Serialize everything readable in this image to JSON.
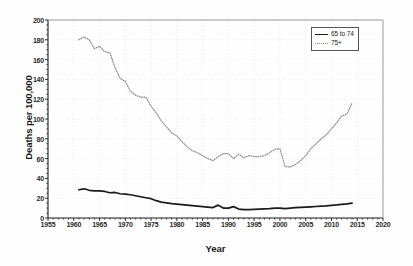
{
  "chart_data": {
    "type": "line",
    "title": "",
    "xlabel": "Year",
    "ylabel": "Deaths per 100,000",
    "xlim": [
      1955,
      2020
    ],
    "ylim": [
      0,
      200
    ],
    "xticks": [
      1955,
      1960,
      1965,
      1970,
      1975,
      1980,
      1985,
      1990,
      1995,
      2000,
      2005,
      2010,
      2015,
      2020
    ],
    "yticks": [
      0,
      20,
      40,
      60,
      80,
      100,
      120,
      140,
      160,
      180,
      200
    ],
    "grid": true,
    "legend_position": "top-right",
    "x": [
      1961,
      1962,
      1963,
      1964,
      1965,
      1966,
      1967,
      1968,
      1969,
      1970,
      1971,
      1972,
      1973,
      1974,
      1975,
      1976,
      1977,
      1978,
      1979,
      1980,
      1981,
      1982,
      1983,
      1984,
      1985,
      1986,
      1987,
      1988,
      1989,
      1990,
      1991,
      1992,
      1993,
      1994,
      1995,
      1996,
      1997,
      1998,
      1999,
      2000,
      2001,
      2002,
      2003,
      2004,
      2005,
      2006,
      2007,
      2008,
      2009,
      2010,
      2011,
      2012,
      2013,
      2014
    ],
    "series": [
      {
        "name": "65 to 74",
        "style": "solid",
        "color": "#1a1a1a",
        "values": [
          28.5,
          29.5,
          28.0,
          27.5,
          27.3,
          26.8,
          25.5,
          25.8,
          24.5,
          24.2,
          23.5,
          22.5,
          21.5,
          20.5,
          19.5,
          17.5,
          16.0,
          15.2,
          14.5,
          14.0,
          13.5,
          13.0,
          12.5,
          12.0,
          11.5,
          11.0,
          10.5,
          13.0,
          10.0,
          10.0,
          11.5,
          9.0,
          8.5,
          8.5,
          8.8,
          9.0,
          9.2,
          9.5,
          10.0,
          10.0,
          9.5,
          10.0,
          10.5,
          10.8,
          11.0,
          11.3,
          11.6,
          12.0,
          12.3,
          12.8,
          13.2,
          13.8,
          14.3,
          15.0
        ]
      },
      {
        "name": "75+",
        "style": "dotted",
        "color": "#8a8a8a",
        "values": [
          180.0,
          183.0,
          180.0,
          171.0,
          173.5,
          168.0,
          167.0,
          152.0,
          141.0,
          138.0,
          128.0,
          124.0,
          122.0,
          122.0,
          113.0,
          106.0,
          98.0,
          92.0,
          86.0,
          83.0,
          77.0,
          72.0,
          68.0,
          66.0,
          63.0,
          60.0,
          58.0,
          62.0,
          65.0,
          65.0,
          60.0,
          64.5,
          61.0,
          63.0,
          62.0,
          62.0,
          63.0,
          66.0,
          69.5,
          70.0,
          52.0,
          51.5,
          54.0,
          58.0,
          63.0,
          70.0,
          75.0,
          80.0,
          84.0,
          90.0,
          96.0,
          103.0,
          105.0,
          116.0
        ]
      }
    ]
  },
  "legend": {
    "entries": [
      {
        "label": "65 to 74",
        "swatch": "solid-line-swatch"
      },
      {
        "label": "75+",
        "swatch": "dotted-line-swatch"
      }
    ]
  }
}
